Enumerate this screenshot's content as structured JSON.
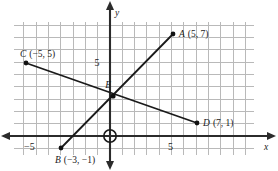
{
  "chart_data": {
    "type": "scatter",
    "title": "",
    "xlabel": "x",
    "ylabel": "y",
    "grid": true,
    "legend": null,
    "xlim": [
      -8,
      12
    ],
    "ylim": [
      -2,
      10
    ],
    "xticks": [
      -5,
      5
    ],
    "yticks": [
      5
    ],
    "xtick_labels": [
      "−5",
      "5"
    ],
    "ytick_labels": [
      "5"
    ],
    "origin_marker": "circle",
    "points": [
      {
        "name": "A",
        "x": 5,
        "y": 7,
        "label": "A",
        "coords": "(5, 7)"
      },
      {
        "name": "B",
        "x": -3,
        "y": -1,
        "label": "B",
        "coords": "(−3, −1)"
      },
      {
        "name": "C",
        "x": -5,
        "y": 5,
        "label": "C",
        "coords": "(−5, 5)"
      },
      {
        "name": "D",
        "x": 7,
        "y": 1,
        "label": "D",
        "coords": "(7, 1)"
      },
      {
        "name": "E",
        "x": 0.2,
        "y": 2.9,
        "label": "E",
        "coords": ""
      }
    ],
    "segments": [
      {
        "name": "AB",
        "from": "B",
        "to": "A",
        "x1": -3,
        "y1": -1,
        "x2": 5,
        "y2": 7
      },
      {
        "name": "CD",
        "from": "C",
        "to": "D",
        "x1": -5,
        "y1": 5,
        "x2": 7,
        "y2": 1
      }
    ],
    "intersection": {
      "name": "E",
      "x": 0.2,
      "y": 2.9
    }
  },
  "axes": {
    "x_axis_name": "x",
    "y_axis_name": "y",
    "x_neg_tick": "−5",
    "x_pos_tick": "5",
    "y_pos_tick": "5"
  },
  "labels": {
    "point_a": "A",
    "point_a_coords": "(5, 7)",
    "point_b": "B",
    "point_b_coords": "(−3, −1)",
    "point_c": "C",
    "point_c_coords": "(−5, 5)",
    "point_d": "D",
    "point_d_coords": "(7, 1)",
    "point_e": "E"
  },
  "colors": {
    "grid": "#b9b9b9",
    "axis": "#2b2b2b",
    "segment": "#1a1a1a",
    "text": "#1a1a1a",
    "background": "#ffffff"
  }
}
